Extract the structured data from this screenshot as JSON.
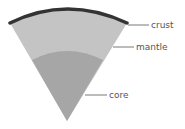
{
  "diagram": {
    "title": "",
    "layers": [
      {
        "name": "crust",
        "label": "crust",
        "color": "#333333"
      },
      {
        "name": "mantle",
        "label": "mantle",
        "color": "#c4c4c4"
      },
      {
        "name": "core",
        "label": "core",
        "color": "#a6a6a6"
      }
    ],
    "leader_color": "#555555",
    "background": "#ffffff"
  }
}
